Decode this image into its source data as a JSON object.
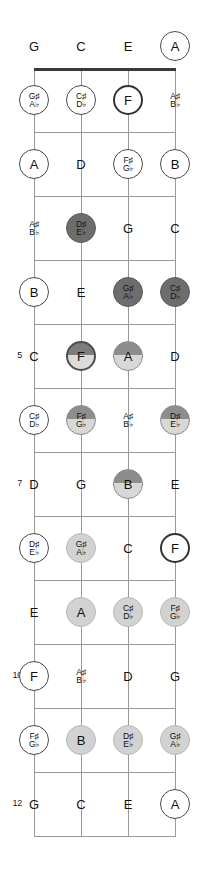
{
  "diagram": {
    "instrument": "ukulele",
    "tuning": [
      "G",
      "C",
      "E",
      "A"
    ],
    "string_count": 4,
    "fret_count": 12,
    "marker_legend": {
      "plain": "no marker",
      "ring": "open white circle outline",
      "ring-thick": "bold white circle outline",
      "light": "light gray filled circle",
      "mid": "medium gray half-shaded circle",
      "mid-ring": "medium gray half-shaded circle with bold outline",
      "dark": "dark gray filled circle"
    },
    "fret_numbers": [
      {
        "fret": 5,
        "label": "5"
      },
      {
        "fret": 7,
        "label": "7"
      },
      {
        "fret": 10,
        "label": "10"
      },
      {
        "fret": 12,
        "label": "12"
      }
    ],
    "geometry": {
      "string_x": [
        34,
        81,
        128,
        175
      ],
      "nut_y": 68,
      "fret_spacing": 64,
      "open_row_y": 46
    },
    "rows": [
      {
        "fret": 0,
        "notes": [
          {
            "main": "G",
            "alt": "",
            "style": "plain"
          },
          {
            "main": "C",
            "alt": "",
            "style": "plain"
          },
          {
            "main": "E",
            "alt": "",
            "style": "plain"
          },
          {
            "main": "A",
            "alt": "",
            "style": "ring"
          }
        ]
      },
      {
        "fret": 1,
        "notes": [
          {
            "main": "G♯",
            "alt": "A♭",
            "style": "ring"
          },
          {
            "main": "C♯",
            "alt": "D♭",
            "style": "ring"
          },
          {
            "main": "F",
            "alt": "",
            "style": "ring-thick"
          },
          {
            "main": "A♯",
            "alt": "B♭",
            "style": "plain"
          }
        ]
      },
      {
        "fret": 2,
        "notes": [
          {
            "main": "A",
            "alt": "",
            "style": "ring"
          },
          {
            "main": "D",
            "alt": "",
            "style": "plain"
          },
          {
            "main": "F♯",
            "alt": "G♭",
            "style": "ring"
          },
          {
            "main": "B",
            "alt": "",
            "style": "ring"
          }
        ]
      },
      {
        "fret": 3,
        "notes": [
          {
            "main": "A♯",
            "alt": "B♭",
            "style": "plain"
          },
          {
            "main": "D♯",
            "alt": "E♭",
            "style": "dark"
          },
          {
            "main": "G",
            "alt": "",
            "style": "plain"
          },
          {
            "main": "C",
            "alt": "",
            "style": "plain"
          }
        ]
      },
      {
        "fret": 4,
        "notes": [
          {
            "main": "B",
            "alt": "",
            "style": "ring"
          },
          {
            "main": "E",
            "alt": "",
            "style": "plain"
          },
          {
            "main": "G♯",
            "alt": "A♭",
            "style": "dark"
          },
          {
            "main": "C♯",
            "alt": "D♭",
            "style": "dark"
          }
        ]
      },
      {
        "fret": 5,
        "notes": [
          {
            "main": "C",
            "alt": "",
            "style": "plain"
          },
          {
            "main": "F",
            "alt": "",
            "style": "mid-ring"
          },
          {
            "main": "A",
            "alt": "",
            "style": "mid"
          },
          {
            "main": "D",
            "alt": "",
            "style": "plain"
          }
        ]
      },
      {
        "fret": 6,
        "notes": [
          {
            "main": "C♯",
            "alt": "D♭",
            "style": "ring"
          },
          {
            "main": "F♯",
            "alt": "G♭",
            "style": "mid"
          },
          {
            "main": "A♯",
            "alt": "B♭",
            "style": "plain"
          },
          {
            "main": "D♯",
            "alt": "E♭",
            "style": "mid"
          }
        ]
      },
      {
        "fret": 7,
        "notes": [
          {
            "main": "D",
            "alt": "",
            "style": "plain"
          },
          {
            "main": "G",
            "alt": "",
            "style": "plain"
          },
          {
            "main": "B",
            "alt": "",
            "style": "mid"
          },
          {
            "main": "E",
            "alt": "",
            "style": "plain"
          }
        ]
      },
      {
        "fret": 8,
        "notes": [
          {
            "main": "D♯",
            "alt": "E♭",
            "style": "ring"
          },
          {
            "main": "G♯",
            "alt": "A♭",
            "style": "light"
          },
          {
            "main": "C",
            "alt": "",
            "style": "plain"
          },
          {
            "main": "F",
            "alt": "",
            "style": "ring-thick"
          }
        ]
      },
      {
        "fret": 9,
        "notes": [
          {
            "main": "E",
            "alt": "",
            "style": "plain"
          },
          {
            "main": "A",
            "alt": "",
            "style": "light"
          },
          {
            "main": "C♯",
            "alt": "D♭",
            "style": "light"
          },
          {
            "main": "F♯",
            "alt": "G♭",
            "style": "light"
          }
        ]
      },
      {
        "fret": 10,
        "notes": [
          {
            "main": "F",
            "alt": "",
            "style": "ring"
          },
          {
            "main": "A♯",
            "alt": "B♭",
            "style": "plain"
          },
          {
            "main": "D",
            "alt": "",
            "style": "plain"
          },
          {
            "main": "G",
            "alt": "",
            "style": "plain"
          }
        ]
      },
      {
        "fret": 11,
        "notes": [
          {
            "main": "F♯",
            "alt": "G♭",
            "style": "ring"
          },
          {
            "main": "B",
            "alt": "",
            "style": "light"
          },
          {
            "main": "D♯",
            "alt": "E♭",
            "style": "light"
          },
          {
            "main": "G♯",
            "alt": "A♭",
            "style": "light"
          }
        ]
      },
      {
        "fret": 12,
        "notes": [
          {
            "main": "G",
            "alt": "",
            "style": "plain"
          },
          {
            "main": "C",
            "alt": "",
            "style": "plain"
          },
          {
            "main": "E",
            "alt": "",
            "style": "plain"
          },
          {
            "main": "A",
            "alt": "",
            "style": "ring"
          }
        ]
      }
    ]
  }
}
